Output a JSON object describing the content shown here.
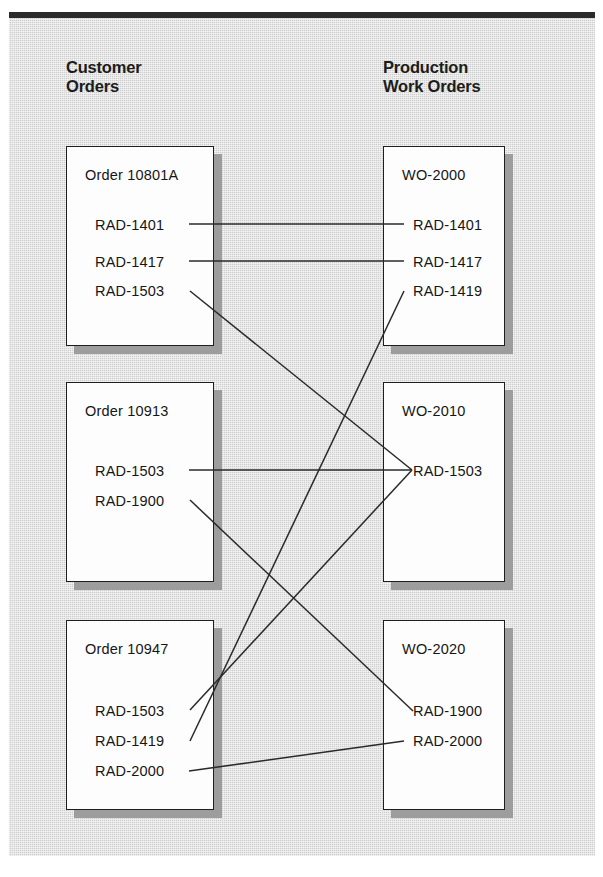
{
  "diagram": {
    "title_rule": "top-divider",
    "columns": [
      {
        "id": "customer-orders",
        "label": "Customer\nOrders"
      },
      {
        "id": "production-work-orders",
        "label": "Production\nWork Orders"
      }
    ],
    "left_boxes": [
      {
        "id": "order-10801a",
        "title": "Order 10801A",
        "items": [
          "RAD-1401",
          "RAD-1417",
          "RAD-1503"
        ]
      },
      {
        "id": "order-10913",
        "title": "Order 10913",
        "items": [
          "RAD-1503",
          "RAD-1900"
        ]
      },
      {
        "id": "order-10947",
        "title": "Order 10947",
        "items": [
          "RAD-1503",
          "RAD-1419",
          "RAD-2000"
        ]
      }
    ],
    "right_boxes": [
      {
        "id": "wo-2000",
        "title": "WO-2000",
        "items": [
          "RAD-1401",
          "RAD-1417",
          "RAD-1419"
        ]
      },
      {
        "id": "wo-2010",
        "title": "WO-2010",
        "items": [
          "RAD-1503"
        ]
      },
      {
        "id": "wo-2020",
        "title": "WO-2020",
        "items": [
          "RAD-1900",
          "RAD-2000"
        ]
      }
    ],
    "connectors": [
      {
        "id": "link-10801a-1401-to-wo2000-1401",
        "from": "Order 10801A / RAD-1401",
        "to": "WO-2000 / RAD-1401"
      },
      {
        "id": "link-10801a-1417-to-wo2000-1417",
        "from": "Order 10801A / RAD-1417",
        "to": "WO-2000 / RAD-1417"
      },
      {
        "id": "link-10801a-1503-to-wo2010-1503",
        "from": "Order 10801A / RAD-1503",
        "to": "WO-2010 / RAD-1503"
      },
      {
        "id": "link-10913-1503-to-wo2010-1503",
        "from": "Order 10913 / RAD-1503",
        "to": "WO-2010 / RAD-1503"
      },
      {
        "id": "link-10913-1900-to-wo2020-1900",
        "from": "Order 10913 / RAD-1900",
        "to": "WO-2020 / RAD-1900"
      },
      {
        "id": "link-10947-1503-to-wo2010-1503",
        "from": "Order 10947 / RAD-1503",
        "to": "WO-2010 / RAD-1503"
      },
      {
        "id": "link-10947-1419-to-wo2000-1419",
        "from": "Order 10947 / RAD-1419",
        "to": "WO-2000 / RAD-1419"
      },
      {
        "id": "link-10947-2000-to-wo2020-2000",
        "from": "Order 10947 / RAD-2000",
        "to": "WO-2020 / RAD-2000"
      }
    ],
    "colors": {
      "background": "#ffffff",
      "canvas": "#cfcfcf",
      "rule": "#2b2b2b",
      "box_fill": "#fdfdfd",
      "box_border": "#1f1f1f",
      "shadow": "#9d9d9d",
      "text": "#161616"
    }
  }
}
